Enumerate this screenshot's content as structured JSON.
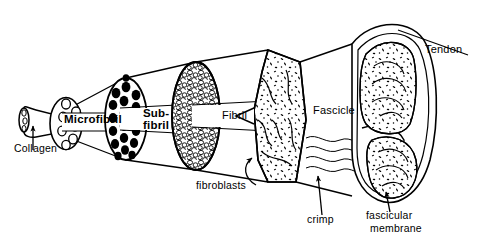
{
  "figure": {
    "background_color": "#ffffff",
    "ink_color": "#000000",
    "width": 495,
    "height": 245
  },
  "labels": {
    "collagen": "Collagen",
    "microfibril": "Microfibril",
    "subfibril_line1": "Sub-",
    "subfibril_line2": "fibril",
    "fibril": "Fibril",
    "fascicle": "Fascicle",
    "tendon": "Tendon",
    "fibroblasts": "fibroblasts",
    "crimp": "crimp",
    "fascicular_line1": "fascicular",
    "fascicular_line2": "membrane"
  },
  "structures": [
    {
      "name": "collagen-molecule",
      "label": "Collagen",
      "order": 1,
      "description": "small cylinder with open circular cross-section at far left",
      "fill": "none",
      "texture": "hollow-tube"
    },
    {
      "name": "microfibril",
      "label": "Microfibril",
      "order": 2,
      "description": "cone with open circles cross-section",
      "fill": "none",
      "texture": "open-circles",
      "element_count": 7
    },
    {
      "name": "subfibril",
      "label": "Sub-fibril",
      "order": 3,
      "description": "cone with solid black dots cross-section",
      "fill": "#000000",
      "texture": "filled-dots",
      "element_count": 19
    },
    {
      "name": "fibril",
      "label": "Fibril",
      "order": 4,
      "description": "cone with cobblestone / pebble packed cross-section",
      "fill": "none",
      "texture": "cobblestone"
    },
    {
      "name": "fascicle",
      "label": "Fascicle",
      "order": 5,
      "description": "large faceted bundle with speckles, fibroblasts and crimp waves",
      "fill": "none",
      "texture": "speckled-with-wavy-fibres"
    },
    {
      "name": "tendon",
      "label": "Tendon",
      "order": 6,
      "description": "whole tendon, two fascicles inside fascicular membrane",
      "fill": "none",
      "texture": "speckled-bundles"
    }
  ],
  "annotations": [
    {
      "name": "collagen-pointer",
      "label": "Collagen",
      "target": "collagen-molecule",
      "style": "arrow"
    },
    {
      "name": "fibroblasts-pointer",
      "label": "fibroblasts",
      "target": "fascicle",
      "style": "arrow"
    },
    {
      "name": "crimp-pointer",
      "label": "crimp",
      "target": "crimp-waves",
      "style": "arrow"
    },
    {
      "name": "fascicular-pointer",
      "label": "fascicular membrane",
      "target": "tendon-membrane",
      "style": "arrow"
    },
    {
      "name": "tendon-pointer",
      "label": "Tendon",
      "target": "tendon",
      "style": "leader-line"
    }
  ],
  "crimp": {
    "wave_count": 3,
    "description": "wavy parallel lines between fascicle and tendon"
  }
}
